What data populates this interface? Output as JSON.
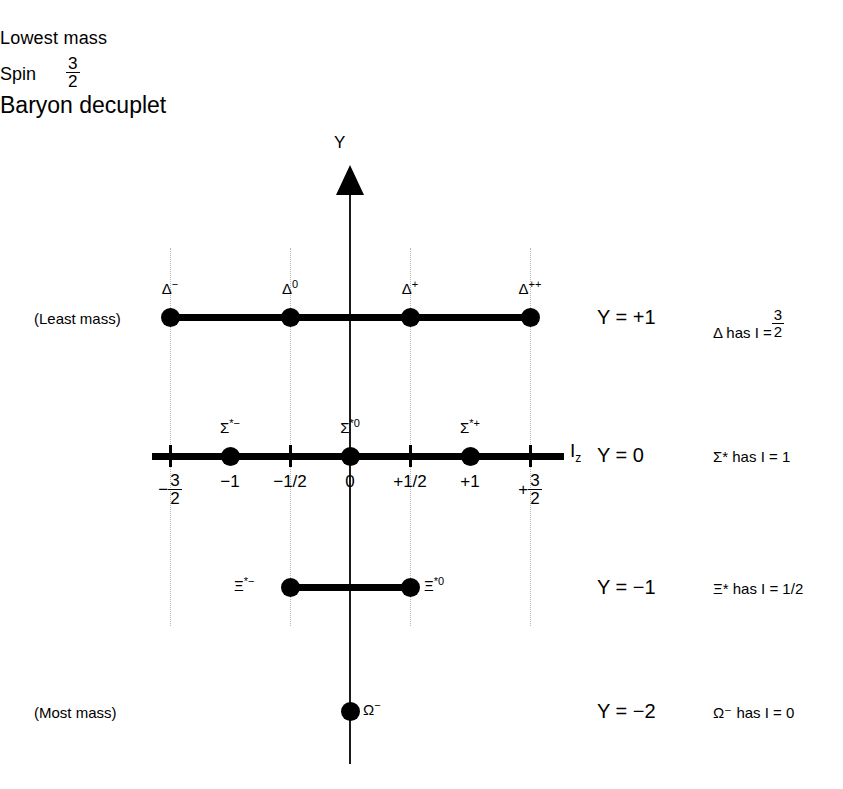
{
  "title": {
    "line1": "Lowest mass",
    "spin_word": "Spin",
    "spin_num": "3",
    "spin_den": "2",
    "line3": "Baryon decuplet"
  },
  "axes": {
    "y_label": "Y",
    "x_label_main": "I",
    "x_label_sub": "z"
  },
  "tick_labels": [
    {
      "id": "neg-three-halves",
      "sign": "−",
      "num": "3",
      "den": "2",
      "x": 170
    },
    {
      "id": "neg-one",
      "text": "−1",
      "x": 230
    },
    {
      "id": "neg-one-half",
      "text": "−1/2",
      "x": 290
    },
    {
      "id": "zero",
      "text": "0",
      "x": 350
    },
    {
      "id": "pos-one-half",
      "text": "+1/2",
      "x": 410
    },
    {
      "id": "pos-one",
      "text": "+1",
      "x": 470
    },
    {
      "id": "pos-three-halves",
      "sign": "+",
      "num": "3",
      "den": "2",
      "x": 530
    }
  ],
  "rows": [
    {
      "id": "delta",
      "y_value": "Y = +1",
      "isospin_text_pre": "Δ has I =",
      "isospin_frac_num": "3",
      "isospin_frac_den": "2",
      "mass_note": "(Least mass)",
      "particles": [
        {
          "base": "Δ",
          "sup": "−",
          "x": 170
        },
        {
          "base": "Δ",
          "sup": "0",
          "x": 290
        },
        {
          "base": "Δ",
          "sup": "+",
          "x": 410
        },
        {
          "base": "Δ",
          "sup": "++",
          "x": 530
        }
      ]
    },
    {
      "id": "sigma-star",
      "y_value": "Y = 0",
      "isospin_text_pre": "Σ* has I = 1",
      "particles": [
        {
          "base": "Σ",
          "sup": "*−",
          "x": 230
        },
        {
          "base": "Σ",
          "sup": "*0",
          "x": 350
        },
        {
          "base": "Σ",
          "sup": "*+",
          "x": 470
        }
      ]
    },
    {
      "id": "xi-star",
      "y_value": "Y = −1",
      "isospin_text_pre": "Ξ* has I = 1/2",
      "particles": [
        {
          "base": "Ξ",
          "sup": "*−",
          "x": 290
        },
        {
          "base": "Ξ",
          "sup": "*0",
          "x": 410
        }
      ]
    },
    {
      "id": "omega",
      "y_value": "Y = −2",
      "isospin_text_pre": "Ω⁻ has I = 0",
      "mass_note": "(Most mass)",
      "particles": [
        {
          "base": "Ω",
          "sup": "−",
          "x": 350
        }
      ]
    }
  ],
  "chart_data": {
    "type": "scatter",
    "title": "Baryon decuplet",
    "subtitle": "Lowest mass, Spin 3/2",
    "xlabel": "I_z",
    "ylabel": "Y",
    "xlim": [
      -1.5,
      1.5
    ],
    "ylim": [
      -2,
      1
    ],
    "grid": "dotted vertical guides at I_z = -3/2, -1/2, +1/2, +3/2",
    "legend": "none",
    "xticks": [
      "-3/2",
      "-1",
      "-1/2",
      "0",
      "+1/2",
      "+1",
      "+3/2"
    ],
    "points": [
      {
        "label": "Δ−",
        "Iz": -1.5,
        "Y": 1
      },
      {
        "label": "Δ0",
        "Iz": -0.5,
        "Y": 1
      },
      {
        "label": "Δ+",
        "Iz": 0.5,
        "Y": 1
      },
      {
        "label": "Δ++",
        "Iz": 1.5,
        "Y": 1
      },
      {
        "label": "Σ*−",
        "Iz": -1.0,
        "Y": 0
      },
      {
        "label": "Σ*0",
        "Iz": 0.0,
        "Y": 0
      },
      {
        "label": "Σ*+",
        "Iz": 1.0,
        "Y": 0
      },
      {
        "label": "Ξ*−",
        "Iz": -0.5,
        "Y": -1
      },
      {
        "label": "Ξ*0",
        "Iz": 0.5,
        "Y": -1
      },
      {
        "label": "Ω−",
        "Iz": 0.0,
        "Y": -2
      }
    ],
    "annotations": [
      "(Least mass)",
      "(Most mass)",
      "Y = +1",
      "Y = 0",
      "Y = −1",
      "Y = −2",
      "Δ has I = 3/2",
      "Σ* has I = 1",
      "Ξ* has I = 1/2",
      "Ω⁻ has I = 0"
    ]
  }
}
